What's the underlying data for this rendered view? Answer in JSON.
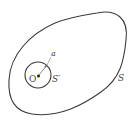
{
  "diagram": {
    "outer_surface": {
      "label": "S"
    },
    "inner_sphere": {
      "label": "S′"
    },
    "center_point": {
      "label": "O"
    },
    "radius": {
      "label": "a"
    },
    "colors": {
      "stroke": "#3a3a3a",
      "text": "#444444",
      "background": "#ffffff"
    }
  }
}
